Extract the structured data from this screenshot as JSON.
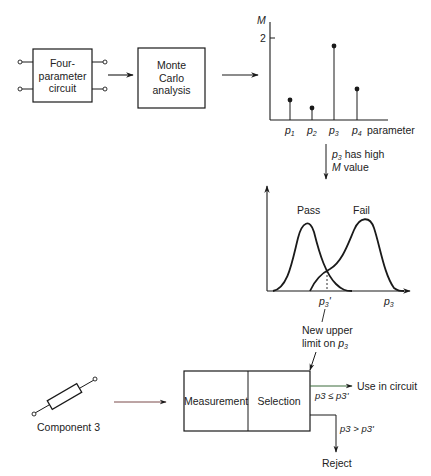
{
  "blocks": {
    "circuit": {
      "lines": [
        "Four-",
        "parameter",
        "circuit"
      ]
    },
    "monte_carlo": {
      "lines": [
        "Monte",
        "Carlo",
        "analysis"
      ]
    },
    "measurement": "Measurement",
    "selection": "Selection"
  },
  "sensitivity_plot": {
    "y_axis_label": "M",
    "y_tick": "2",
    "x_axis_label": "parameter",
    "parameters": [
      {
        "name": "p",
        "sub": "1",
        "relative_M": 0.42
      },
      {
        "name": "p",
        "sub": "2",
        "relative_M": 0.23
      },
      {
        "name": "p",
        "sub": "3",
        "relative_M": 1.8
      },
      {
        "name": "p",
        "sub": "4",
        "relative_M": 0.7
      }
    ]
  },
  "annotation_high_m": {
    "line1_var": "p",
    "line1_sub": "3",
    "line1_rest": " has high",
    "line2_var": "M",
    "line2_rest": " value"
  },
  "distribution_plot": {
    "pass_label": "Pass",
    "fail_label": "Fail",
    "threshold_label": "p",
    "threshold_sub": "3",
    "threshold_prime": "'",
    "x_axis_label": "p",
    "x_axis_sub": "3"
  },
  "annotation_limit": {
    "line1": "New upper",
    "line2_text": "limit on ",
    "line2_var": "p",
    "line2_sub": "3"
  },
  "component": {
    "label": "Component 3"
  },
  "outputs": {
    "accept": {
      "label": "Use in circuit",
      "condition": "p3 ≤ p3'"
    },
    "reject": {
      "label": "Reject",
      "condition": "p3 > p3'"
    }
  },
  "colors": {
    "line": "#1a1a1a",
    "background": "#ffffff"
  }
}
